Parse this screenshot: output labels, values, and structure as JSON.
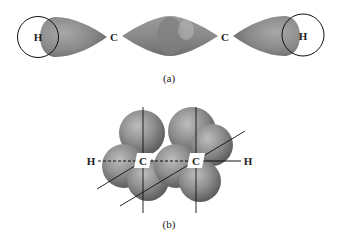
{
  "figure_a": {
    "caption": "(a)",
    "labels": {
      "h_left": "H",
      "c_left": "C",
      "c_right": "C",
      "h_right": "H"
    },
    "description": "sigma bond overlap of sp hybrid orbitals along C-C-H axis"
  },
  "figure_b": {
    "caption": "(b)",
    "labels": {
      "h_left": "H",
      "c_left": "C",
      "c_right": "C",
      "h_right": "H"
    },
    "description": "perpendicular p orbitals forming pi bonds around carbon-carbon axis"
  },
  "colors": {
    "lobe_dark": "#6e6e6e",
    "lobe_mid": "#8c8c8c",
    "lobe_light": "#b4b4b4",
    "line": "#111111",
    "background": "#ffffff"
  }
}
